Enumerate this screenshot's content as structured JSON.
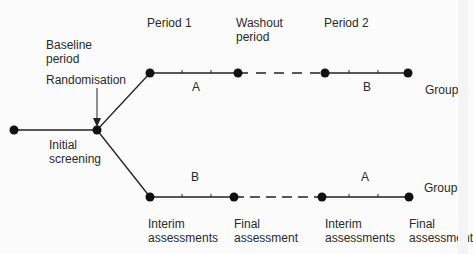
{
  "diagram": {
    "type": "crossover-trial-design",
    "phases": {
      "period1": "Period  1",
      "washout": "Washout\nperiod",
      "period2": "Period  2",
      "baseline": "Baseline\nperiod",
      "randomisation": "Randomisation",
      "initial_screening": "Initial\nscreening"
    },
    "groups": {
      "group1": {
        "label": "Group  1",
        "period1_treatment": "A",
        "period2_treatment": "B"
      },
      "group2": {
        "label": "Group  2",
        "period1_treatment": "B",
        "period2_treatment": "A"
      }
    },
    "assessments": {
      "interim1": "Interim\nassessments",
      "final1": "Final\nassessment",
      "interim2": "Interim\nassessments",
      "final2": "Final\nassessment"
    },
    "colors": {
      "line": "#1a1a1a",
      "node": "#111111",
      "background": "#fbfbfb"
    }
  }
}
